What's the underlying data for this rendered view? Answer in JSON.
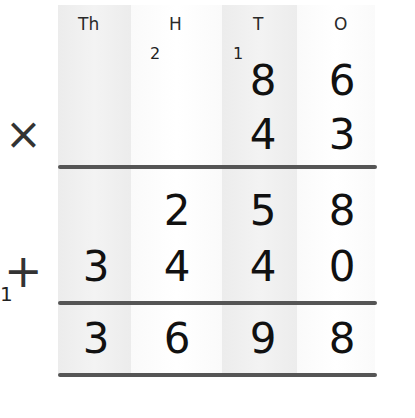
{
  "place_value_headers": [
    "Th",
    "H",
    "T",
    "O"
  ],
  "carries": {
    "hundreds": "2",
    "tens": "1",
    "addition": "1"
  },
  "multiplicand": [
    "",
    "",
    "8",
    "6"
  ],
  "multiplier": [
    "",
    "",
    "4",
    "3"
  ],
  "partial_product_1": [
    "",
    "2",
    "5",
    "8"
  ],
  "partial_product_2": [
    "3",
    "4",
    "4",
    "0"
  ],
  "result": [
    "3",
    "6",
    "9",
    "8"
  ],
  "operators": {
    "multiply": "×",
    "add": "+"
  },
  "colors": {
    "shaded_column": "#ececec",
    "rule": "#555555",
    "text": "#111111"
  }
}
